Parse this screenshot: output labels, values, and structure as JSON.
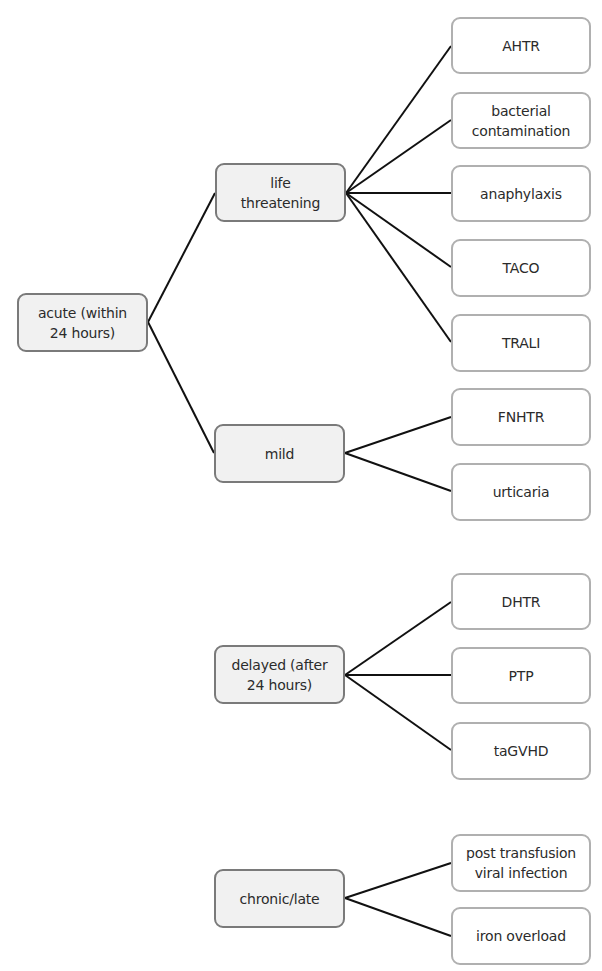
{
  "diagram": {
    "type": "tree",
    "colors": {
      "category_fill": "#f1f1f1",
      "category_border": "#7a7a7a",
      "leaf_fill": "#ffffff",
      "leaf_border": "#b0b0b0",
      "connector": "#111111",
      "text": "#2b2b2b"
    },
    "nodes": {
      "acute": {
        "label": "acute (within\n24 hours)",
        "x": 17,
        "y": 293,
        "w": 131,
        "h": 59
      },
      "life_threatening": {
        "label": "life\nthreatening",
        "x": 215,
        "y": 163,
        "w": 131,
        "h": 59
      },
      "mild": {
        "label": "mild",
        "x": 214,
        "y": 424,
        "w": 131,
        "h": 59
      },
      "delayed": {
        "label": "delayed (after\n24 hours)",
        "x": 214,
        "y": 645,
        "w": 131,
        "h": 59
      },
      "chronic_late": {
        "label": "chronic/late",
        "x": 214,
        "y": 869,
        "w": 131,
        "h": 59
      },
      "ahtr": {
        "label": "AHTR",
        "x": 451,
        "y": 17,
        "w": 140,
        "h": 57
      },
      "bacterial_contamination": {
        "label": "bacterial\ncontamination",
        "x": 451,
        "y": 92,
        "w": 140,
        "h": 57
      },
      "anaphylaxis": {
        "label": "anaphylaxis",
        "x": 451,
        "y": 165,
        "w": 140,
        "h": 57
      },
      "taco": {
        "label": "TACO",
        "x": 451,
        "y": 239,
        "w": 140,
        "h": 58
      },
      "trali": {
        "label": "TRALI",
        "x": 451,
        "y": 314,
        "w": 140,
        "h": 58
      },
      "fnhtr": {
        "label": "FNHTR",
        "x": 451,
        "y": 388,
        "w": 140,
        "h": 58
      },
      "urticaria": {
        "label": "urticaria",
        "x": 451,
        "y": 463,
        "w": 140,
        "h": 58
      },
      "dhtr": {
        "label": "DHTR",
        "x": 451,
        "y": 573,
        "w": 140,
        "h": 57
      },
      "ptp": {
        "label": "PTP",
        "x": 451,
        "y": 647,
        "w": 140,
        "h": 57
      },
      "tagvhd": {
        "label": "taGVHD",
        "x": 451,
        "y": 722,
        "w": 140,
        "h": 58
      },
      "post_transfusion_viral_infection": {
        "label": "post transfusion\nviral infection",
        "x": 451,
        "y": 834,
        "w": 140,
        "h": 58
      },
      "iron_overload": {
        "label": "iron overload",
        "x": 451,
        "y": 907,
        "w": 140,
        "h": 58
      }
    },
    "edges": [
      {
        "from": "acute",
        "to": "life_threatening",
        "x1": 148,
        "y1": 322,
        "x2": 215,
        "y2": 193
      },
      {
        "from": "acute",
        "to": "mild",
        "x1": 148,
        "y1": 322,
        "x2": 214,
        "y2": 453
      },
      {
        "from": "life_threatening",
        "to": "ahtr",
        "x1": 346,
        "y1": 193,
        "x2": 451,
        "y2": 46
      },
      {
        "from": "life_threatening",
        "to": "bacterial_contamination",
        "x1": 346,
        "y1": 193,
        "x2": 451,
        "y2": 120
      },
      {
        "from": "life_threatening",
        "to": "anaphylaxis",
        "x1": 346,
        "y1": 193,
        "x2": 451,
        "y2": 193
      },
      {
        "from": "life_threatening",
        "to": "taco",
        "x1": 346,
        "y1": 193,
        "x2": 451,
        "y2": 267
      },
      {
        "from": "life_threatening",
        "to": "trali",
        "x1": 346,
        "y1": 193,
        "x2": 451,
        "y2": 342
      },
      {
        "from": "mild",
        "to": "fnhtr",
        "x1": 345,
        "y1": 453,
        "x2": 451,
        "y2": 417
      },
      {
        "from": "mild",
        "to": "urticaria",
        "x1": 345,
        "y1": 453,
        "x2": 451,
        "y2": 491
      },
      {
        "from": "delayed",
        "to": "dhtr",
        "x1": 345,
        "y1": 675,
        "x2": 451,
        "y2": 602
      },
      {
        "from": "delayed",
        "to": "ptp",
        "x1": 345,
        "y1": 675,
        "x2": 451,
        "y2": 675
      },
      {
        "from": "delayed",
        "to": "tagvhd",
        "x1": 345,
        "y1": 675,
        "x2": 451,
        "y2": 750
      },
      {
        "from": "chronic_late",
        "to": "post_transfusion_viral_infection",
        "x1": 345,
        "y1": 898,
        "x2": 451,
        "y2": 863
      },
      {
        "from": "chronic_late",
        "to": "iron_overload",
        "x1": 345,
        "y1": 898,
        "x2": 451,
        "y2": 936
      }
    ]
  }
}
